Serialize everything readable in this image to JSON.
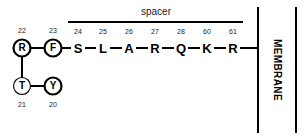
{
  "diagram": {
    "background_color": "#ffffff",
    "line_color": "#000000"
  },
  "spacer": {
    "label": "spacer",
    "bar_present": true
  },
  "membrane": {
    "label": "MEMBRANE",
    "orientation": "vertical",
    "line_count": 2
  },
  "circled_residues": [
    {
      "letter": "R",
      "number": "22",
      "bold_ring": true,
      "cx": 22,
      "cy": 48,
      "number_x": 22,
      "number_y": 30
    },
    {
      "letter": "F",
      "number": "23",
      "bold_ring": true,
      "cx": 53,
      "cy": 48,
      "number_x": 53,
      "number_y": 30
    },
    {
      "letter": "T",
      "number": "21",
      "bold_ring": false,
      "cx": 22,
      "cy": 86,
      "number_x": 22,
      "number_y": 104
    },
    {
      "letter": "Y",
      "number": "20",
      "bold_ring": true,
      "cx": 53,
      "cy": 86,
      "number_x": 53,
      "number_y": 104
    }
  ],
  "chain_residues": [
    {
      "letter": "S",
      "number": "24",
      "x": 78,
      "y": 48,
      "number_x": 78,
      "number_y": 31
    },
    {
      "letter": "L",
      "number": "25",
      "x": 103,
      "y": 48,
      "number_x": 103,
      "number_y": 31
    },
    {
      "letter": "A",
      "number": "26",
      "x": 129,
      "y": 48,
      "number_x": 129,
      "number_y": 31
    },
    {
      "letter": "R",
      "number": "27",
      "x": 155,
      "y": 48,
      "number_x": 155,
      "number_y": 31
    },
    {
      "letter": "Q",
      "number": "28",
      "x": 181,
      "y": 48,
      "number_x": 181,
      "number_y": 31
    },
    {
      "letter": "K",
      "number": "60",
      "x": 207,
      "y": 48,
      "number_x": 207,
      "number_y": 31
    },
    {
      "letter": "R",
      "number": "61",
      "x": 233,
      "y": 48,
      "number_x": 233,
      "number_y": 31
    }
  ],
  "geometry": {
    "spacer_bar": {
      "x1": 68,
      "x2": 243,
      "y": 22
    },
    "spacer_label_pos": {
      "x": 156,
      "y": 12
    },
    "membrane_line_left_x": 258,
    "membrane_line_right_x": 296,
    "membrane_line_top_y": 7,
    "membrane_line_bottom_y": 133,
    "membrane_label_pos": {
      "x": 277,
      "y": 70
    },
    "circle_radius": 8.5
  }
}
